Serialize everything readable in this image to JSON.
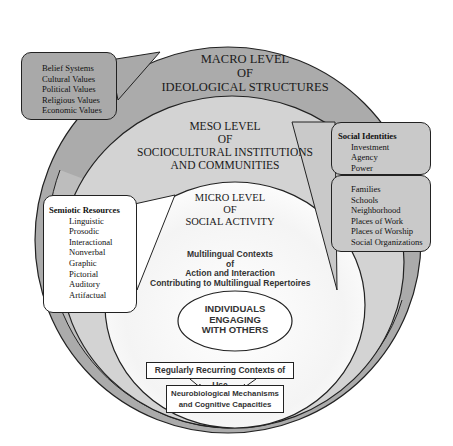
{
  "diagram": {
    "colors": {
      "macro_fill": "#ababab",
      "meso_fill": "#d3d3d3",
      "micro_fill": "#ffffff",
      "outline": "#222222"
    },
    "macro": {
      "title_line1": "MACRO LEVEL",
      "title_line2": "OF",
      "title_line3": "IDEOLOGICAL STRUCTURES",
      "callout": {
        "items": [
          "Belief Systems",
          "Cultural Values",
          "Political Values",
          "Religious Values",
          "Economic Values"
        ]
      }
    },
    "meso": {
      "title_line1": "MESO LEVEL",
      "title_line2": "OF",
      "title_line3": "SOCIOCULTURAL INSTITUTIONS",
      "title_line4": "AND COMMUNITIES",
      "identities_callout": {
        "heading": "Social Identities",
        "items": [
          "Investment",
          "Agency",
          "Power"
        ]
      },
      "institutions_callout": {
        "items": [
          "Families",
          "Schools",
          "Neighborhood",
          "Places of Work",
          "Places of Worship",
          "Social Organizations"
        ]
      }
    },
    "micro": {
      "title_line1": "MICRO LEVEL",
      "title_line2": "OF",
      "title_line3": "SOCIAL ACTIVITY",
      "contexts_line1": "Multilingual Contexts",
      "contexts_line2": "of",
      "contexts_line3": "Action and Interaction",
      "contexts_line4": "Contributing to Multilingual Repertoires",
      "individuals_line1": "INDIVIDUALS",
      "individuals_line2": "ENGAGING",
      "individuals_line3": "WITH  OTHERS",
      "semiotic_callout": {
        "heading": "Semiotic Resources",
        "items": [
          "Linguistic",
          "Prosodic",
          "Interactional",
          "Nonverbal",
          "Graphic",
          "Pictorial",
          "Auditory",
          "Artifactual"
        ]
      },
      "recurring_label": "Regularly Recurring Contexts of Use",
      "neuro_line1": "Neurobiological Mechanisms",
      "neuro_line2": "and Cognitive Capacities"
    }
  }
}
